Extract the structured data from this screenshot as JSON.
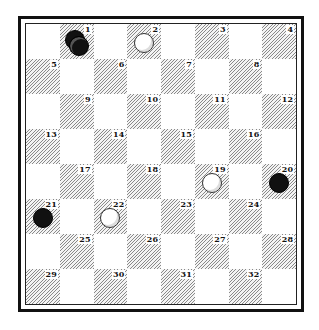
{
  "game": {
    "type": "checkers-diagram",
    "board_size": 8,
    "colors": {
      "dark_square_hatch": "#8a8a8a",
      "light_square": "#ffffff",
      "black_piece": "#111111",
      "white_piece": "#ffffff",
      "border": "#111111"
    }
  },
  "squares": [
    {
      "n": "1"
    },
    {
      "n": "2"
    },
    {
      "n": "3"
    },
    {
      "n": "4"
    },
    {
      "n": "5"
    },
    {
      "n": "6"
    },
    {
      "n": "7"
    },
    {
      "n": "8"
    },
    {
      "n": "9"
    },
    {
      "n": "10"
    },
    {
      "n": "11"
    },
    {
      "n": "12"
    },
    {
      "n": "13"
    },
    {
      "n": "14"
    },
    {
      "n": "15"
    },
    {
      "n": "16"
    },
    {
      "n": "17"
    },
    {
      "n": "18"
    },
    {
      "n": "19"
    },
    {
      "n": "20"
    },
    {
      "n": "21"
    },
    {
      "n": "22"
    },
    {
      "n": "23"
    },
    {
      "n": "24"
    },
    {
      "n": "25"
    },
    {
      "n": "26"
    },
    {
      "n": "27"
    },
    {
      "n": "28"
    },
    {
      "n": "29"
    },
    {
      "n": "30"
    },
    {
      "n": "31"
    },
    {
      "n": "32"
    }
  ],
  "pieces": [
    {
      "square": 1,
      "color": "black",
      "king": true
    },
    {
      "square": 2,
      "color": "white",
      "king": false
    },
    {
      "square": 19,
      "color": "white",
      "king": false
    },
    {
      "square": 20,
      "color": "black",
      "king": false
    },
    {
      "square": 21,
      "color": "black",
      "king": false
    },
    {
      "square": 22,
      "color": "white",
      "king": false
    }
  ]
}
